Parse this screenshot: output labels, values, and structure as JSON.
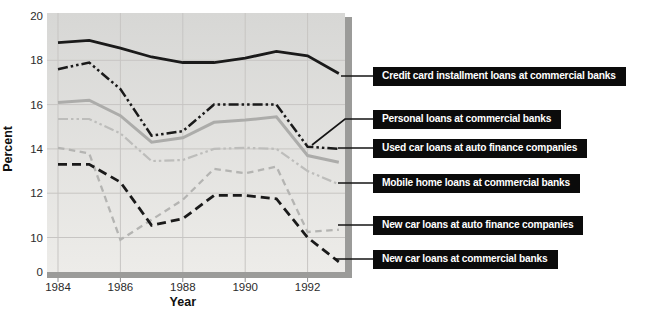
{
  "figure": {
    "ylabel": "Percent",
    "xlabel": "Year"
  },
  "chart_data": {
    "type": "line",
    "title": "",
    "xlabel": "Year",
    "ylabel": "Percent",
    "x": [
      1984,
      1985,
      1986,
      1987,
      1988,
      1989,
      1990,
      1991,
      1992,
      1993
    ],
    "x_tick_labels": [
      "1984",
      "1986",
      "1988",
      "1990",
      "1992"
    ],
    "x_gridline_years": [
      1984,
      1986,
      1988,
      1990,
      1992
    ],
    "y_tick_labels": [
      "20",
      "18",
      "16",
      "14",
      "12",
      "10",
      "0"
    ],
    "y_gridline_values": [
      18,
      16,
      14,
      12,
      10
    ],
    "y_axis_top_value": 20,
    "y_axis_bottom_label": "0",
    "grid": "on",
    "legend_position": "right-callout-bars",
    "series": [
      {
        "label": "Credit card installment loans at commercial banks",
        "line_color": "#1a1a1a",
        "line_style": "solid",
        "stroke_width": 2.8,
        "values": [
          18.8,
          18.9,
          18.55,
          18.15,
          17.9,
          17.9,
          18.1,
          18.4,
          18.2,
          17.4
        ]
      },
      {
        "label": "Personal loans at commercial banks",
        "line_color": "#1a1a1a",
        "line_style": "dash-dot-dot",
        "stroke_width": 2.5,
        "values": [
          17.6,
          17.9,
          16.7,
          14.6,
          14.8,
          16.0,
          16.0,
          16.0,
          14.1,
          14.0
        ]
      },
      {
        "label": "Used car loans at auto finance companies",
        "line_color": "#acacaa",
        "line_style": "solid",
        "stroke_width": 3,
        "values": [
          16.1,
          16.2,
          15.5,
          14.3,
          14.5,
          15.2,
          15.3,
          15.45,
          13.7,
          13.4
        ]
      },
      {
        "label": "Mobile home loans at commercial banks",
        "line_color": "#bdbdbb",
        "line_style": "dash-dot-dot",
        "stroke_width": 2.2,
        "values": [
          15.35,
          15.35,
          14.7,
          13.45,
          13.5,
          14.0,
          14.05,
          14.0,
          13.0,
          12.4
        ]
      },
      {
        "label": "New car loans at auto finance companies",
        "line_color": "#b4b4b2",
        "line_style": "dashed-short",
        "stroke_width": 2.3,
        "values": [
          14.05,
          13.8,
          9.9,
          10.8,
          11.7,
          13.1,
          12.9,
          13.2,
          10.25,
          10.35
        ]
      },
      {
        "label": "New car loans at commercial banks",
        "line_color": "#1a1a1a",
        "line_style": "dashed",
        "stroke_width": 2.8,
        "values": [
          13.3,
          13.3,
          12.5,
          10.55,
          10.85,
          11.9,
          11.9,
          11.75,
          10.0,
          8.9
        ]
      }
    ],
    "plot_colors": {
      "plot_bg_top": "#d7d7d5",
      "plot_bg_bottom": "#edece9",
      "gridline": "#c7c5c3",
      "shadow": "#9b9b99",
      "callout_bg": "#0b0b0b",
      "callout_text": "#ffffff"
    }
  }
}
